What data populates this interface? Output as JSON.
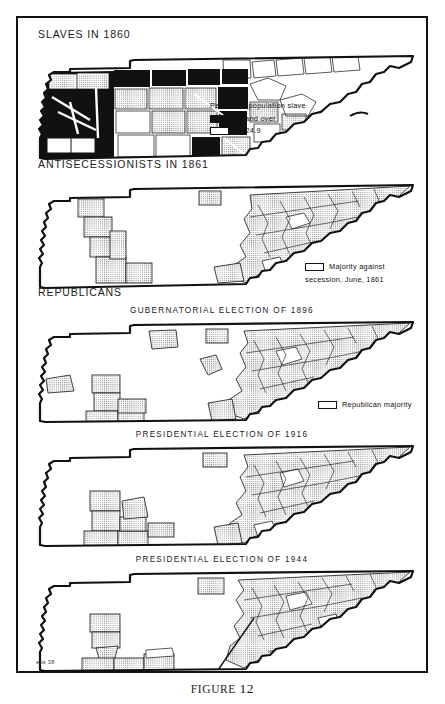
{
  "figure": {
    "caption_label": "FIGURE",
    "caption_number": "12",
    "plate_mark": "eps 38"
  },
  "sections": [
    {
      "heading": "SLAVES IN 1860"
    },
    {
      "heading": "ANTISECESSIONISTS IN 1861"
    },
    {
      "heading": "REPUBLICANS"
    }
  ],
  "maps": [
    {
      "id": "slaves-1860",
      "title": "",
      "legend_title": "Percent of population slave",
      "legend_items": [
        {
          "pattern": "solid",
          "label": "25 and over"
        },
        {
          "pattern": "stipple",
          "label": "15-24.9"
        }
      ]
    },
    {
      "id": "antisecessionists-1861",
      "title": "",
      "legend_title": "",
      "legend_items": [
        {
          "pattern": "stipple",
          "label": "Majority against"
        },
        {
          "pattern": "none",
          "label": "secession, June, 1861"
        }
      ]
    },
    {
      "id": "gubernatorial-1896",
      "title": "GUBERNATORIAL ELECTION OF 1896",
      "legend_title": "",
      "legend_items": [
        {
          "pattern": "stipple",
          "label": "Republican majority"
        }
      ]
    },
    {
      "id": "presidential-1916",
      "title": "PRESIDENTIAL ELECTION OF 1916",
      "legend_title": "",
      "legend_items": []
    },
    {
      "id": "presidential-1944",
      "title": "PRESIDENTIAL ELECTION OF 1944",
      "legend_title": "",
      "legend_items": []
    }
  ],
  "colors": {
    "ink": "#111111",
    "paper": "#ffffff"
  }
}
